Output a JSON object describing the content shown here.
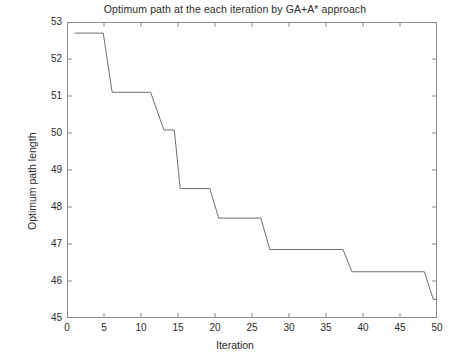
{
  "chart_data": {
    "type": "line",
    "title": "Optimum path at the each iteration by GA+A* approach",
    "xlabel": "Iteration",
    "ylabel": "Optimum path length",
    "xlim": [
      0,
      50
    ],
    "ylim": [
      45,
      53
    ],
    "xticks": [
      0,
      5,
      10,
      15,
      20,
      25,
      30,
      35,
      40,
      45,
      50
    ],
    "yticks": [
      45,
      46,
      47,
      48,
      49,
      50,
      51,
      52,
      53
    ],
    "xtick_labels": [
      "0",
      "5",
      "10",
      "15",
      "20",
      "25",
      "30",
      "35",
      "40",
      "45",
      "50"
    ],
    "ytick_labels": [
      "45",
      "46",
      "47",
      "48",
      "49",
      "50",
      "51",
      "52",
      "53"
    ],
    "grid": false,
    "legend": null,
    "line_color": "#6e6e6e",
    "line_width": 1,
    "drawstyle": "steps-post-with-ramps",
    "series": [
      {
        "name": "Optimum path length",
        "x": [
          1,
          4.9,
          6.1,
          11.3,
          13.1,
          14.5,
          15.3,
          19.3,
          20.5,
          26.2,
          27.4,
          37.3,
          38.5,
          48.3,
          49.5,
          50
        ],
        "values": [
          52.7,
          52.7,
          51.1,
          51.1,
          50.08,
          50.08,
          48.5,
          48.5,
          47.7,
          47.7,
          46.85,
          46.85,
          46.25,
          46.25,
          45.5,
          45.5
        ]
      }
    ],
    "steps": [
      {
        "iteration_start": 1,
        "iteration_end": 5,
        "value": 52.7
      },
      {
        "iteration_start": 6,
        "iteration_end": 11,
        "value": 51.1
      },
      {
        "iteration_start": 13,
        "iteration_end": 14,
        "value": 50.08
      },
      {
        "iteration_start": 15,
        "iteration_end": 19,
        "value": 48.5
      },
      {
        "iteration_start": 21,
        "iteration_end": 26,
        "value": 47.7
      },
      {
        "iteration_start": 27,
        "iteration_end": 37,
        "value": 46.85
      },
      {
        "iteration_start": 39,
        "iteration_end": 48,
        "value": 46.25
      },
      {
        "iteration_start": 50,
        "iteration_end": 50,
        "value": 45.5
      }
    ],
    "annotations": []
  }
}
